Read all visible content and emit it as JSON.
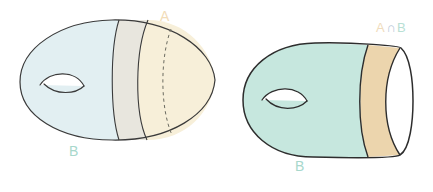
{
  "diagram": {
    "background_color": "#ffffff",
    "figures": [
      {
        "id": "left-figure",
        "name": "genus-one-surface-split",
        "description": "Ellipsoidal genus-1 surface divided into a blue-green region B and a cream region A by two vertical arcs, with a dashed arc indicating the hidden back of the separating circle",
        "center": [
          117,
          80
        ],
        "width": 196,
        "height": 122,
        "regions": [
          {
            "name": "region-B",
            "fill": "#e2eff2",
            "label": "B"
          },
          {
            "name": "region-overlap",
            "fill": "#e8e6de",
            "label": ""
          },
          {
            "name": "region-A",
            "fill": "#f7efd9",
            "label": "A"
          }
        ],
        "handle": {
          "name": "handle-lens",
          "cx": 60,
          "cy": 85,
          "rx": 25,
          "ry": 9
        },
        "dashed_curve": true
      },
      {
        "id": "right-figure",
        "name": "truncated-genus-one-surface",
        "description": "Mint green genus-1 surface with a tan band and a white boundary crescent representing the intersection A and B",
        "center": [
          322,
          100
        ],
        "width": 175,
        "height": 120,
        "regions": [
          {
            "name": "region-B",
            "fill": "#c6e7de",
            "label": "B"
          },
          {
            "name": "region-a-intersect-b",
            "fill": "#ecd5ad",
            "label": "A ∩ B"
          },
          {
            "name": "region-boundary",
            "fill": "#ffffff",
            "label": ""
          }
        ],
        "handle": {
          "name": "handle-lens",
          "cx": 283,
          "cy": 100,
          "rx": 25,
          "ry": 9
        },
        "dashed_curve": false
      }
    ]
  },
  "labels": {
    "a_left": "A",
    "b_left": "B",
    "b_right": "B",
    "a_intersect_b_set_a": "A",
    "a_intersect_b_symbol": "∩",
    "a_intersect_b_set_b": "B"
  },
  "colors": {
    "stroke": "#3a3a3a",
    "left_body_blue": "#e2eff2",
    "left_middle_grey": "#e8e6de",
    "left_right_cream": "#f7efd9",
    "right_body_mint": "#c6e7de",
    "right_band_tan": "#ecd5ad",
    "right_edge_white": "#ffffff",
    "label_green": "#a8d8cc",
    "label_tan": "#f2dcb8",
    "background": "#ffffff"
  }
}
